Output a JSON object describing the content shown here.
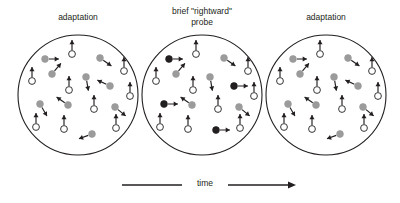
{
  "figure": {
    "type": "motion-adaptation-diagram",
    "width": 400,
    "height": 203,
    "background": "#ffffff",
    "stroke_color": "#231f20",
    "colors": {
      "outline": "#231f20",
      "adapting_dot_fill": "#9b9b9b",
      "probe_dot_fill": "#231f20",
      "open_dot_fill": "#ffffff",
      "text": "#231f20"
    }
  },
  "panels": [
    {
      "id": "panel-left",
      "label": "adaptation",
      "label_lines": [
        "adaptation"
      ],
      "cx": 78,
      "cy": 95,
      "r": 60,
      "label_x": 78,
      "label_y": 12,
      "dots": [
        {
          "x": -33,
          "y": -36,
          "kind": "adapting",
          "angle": 0
        },
        {
          "x": -6,
          "y": -41,
          "kind": "open",
          "angle": -90
        },
        {
          "x": 22,
          "y": -37,
          "kind": "adapting",
          "angle": 35
        },
        {
          "x": -26,
          "y": -21,
          "kind": "adapting",
          "angle": -50
        },
        {
          "x": 46,
          "y": -24,
          "kind": "open",
          "angle": -90
        },
        {
          "x": -46,
          "y": -14,
          "kind": "open",
          "angle": -90
        },
        {
          "x": 8,
          "y": -18,
          "kind": "adapting",
          "angle": 80
        },
        {
          "x": -9,
          "y": -5,
          "kind": "open",
          "angle": -90
        },
        {
          "x": 32,
          "y": -9,
          "kind": "adapting",
          "angle": -155
        },
        {
          "x": 52,
          "y": 1,
          "kind": "open",
          "angle": -90
        },
        {
          "x": -38,
          "y": 9,
          "kind": "adapting",
          "angle": 60
        },
        {
          "x": -10,
          "y": 10,
          "kind": "adapting",
          "angle": -145
        },
        {
          "x": 16,
          "y": 14,
          "kind": "open",
          "angle": -90
        },
        {
          "x": 37,
          "y": 12,
          "kind": "adapting",
          "angle": 40
        },
        {
          "x": -42,
          "y": 32,
          "kind": "open",
          "angle": -90
        },
        {
          "x": -14,
          "y": 34,
          "kind": "open",
          "angle": -90
        },
        {
          "x": 14,
          "y": 39,
          "kind": "adapting",
          "angle": 160
        },
        {
          "x": 38,
          "y": 33,
          "kind": "open",
          "angle": -90
        }
      ]
    },
    {
      "id": "panel-middle",
      "label": "brief \"rightward\" probe",
      "label_lines": [
        "brief \"rightward\"",
        "probe"
      ],
      "cx": 202,
      "cy": 95,
      "r": 60,
      "label_x": 202,
      "label_y": 6,
      "dots": [
        {
          "x": -33,
          "y": -36,
          "kind": "probe",
          "angle": 0
        },
        {
          "x": -6,
          "y": -41,
          "kind": "open",
          "angle": -90
        },
        {
          "x": 22,
          "y": -37,
          "kind": "adapting",
          "angle": 35
        },
        {
          "x": -26,
          "y": -21,
          "kind": "adapting",
          "angle": -50
        },
        {
          "x": 46,
          "y": -24,
          "kind": "open",
          "angle": -90
        },
        {
          "x": -46,
          "y": -14,
          "kind": "open",
          "angle": -90
        },
        {
          "x": 8,
          "y": -18,
          "kind": "adapting",
          "angle": 80
        },
        {
          "x": -9,
          "y": -5,
          "kind": "open",
          "angle": -90
        },
        {
          "x": 32,
          "y": -9,
          "kind": "probe",
          "angle": 0
        },
        {
          "x": 52,
          "y": 1,
          "kind": "open",
          "angle": -90
        },
        {
          "x": -38,
          "y": 9,
          "kind": "probe",
          "angle": 0
        },
        {
          "x": -10,
          "y": 10,
          "kind": "adapting",
          "angle": -145
        },
        {
          "x": 16,
          "y": 14,
          "kind": "open",
          "angle": -90
        },
        {
          "x": 37,
          "y": 12,
          "kind": "adapting",
          "angle": 40
        },
        {
          "x": -42,
          "y": 32,
          "kind": "open",
          "angle": -90
        },
        {
          "x": -14,
          "y": 34,
          "kind": "open",
          "angle": -90
        },
        {
          "x": 14,
          "y": 35,
          "kind": "probe",
          "angle": 0
        },
        {
          "x": 38,
          "y": 33,
          "kind": "open",
          "angle": -90
        }
      ]
    },
    {
      "id": "panel-right",
      "label": "adaptation",
      "label_lines": [
        "adaptation"
      ],
      "cx": 326,
      "cy": 95,
      "r": 60,
      "label_x": 326,
      "label_y": 12,
      "dots": [
        {
          "x": -33,
          "y": -36,
          "kind": "adapting",
          "angle": 0
        },
        {
          "x": -6,
          "y": -41,
          "kind": "open",
          "angle": -90
        },
        {
          "x": 22,
          "y": -37,
          "kind": "adapting",
          "angle": 35
        },
        {
          "x": -26,
          "y": -21,
          "kind": "adapting",
          "angle": -50
        },
        {
          "x": 46,
          "y": -24,
          "kind": "open",
          "angle": -90
        },
        {
          "x": -46,
          "y": -14,
          "kind": "open",
          "angle": -90
        },
        {
          "x": 8,
          "y": -18,
          "kind": "adapting",
          "angle": 80
        },
        {
          "x": -9,
          "y": -5,
          "kind": "open",
          "angle": -90
        },
        {
          "x": 32,
          "y": -9,
          "kind": "adapting",
          "angle": -155
        },
        {
          "x": 52,
          "y": 1,
          "kind": "open",
          "angle": -90
        },
        {
          "x": -38,
          "y": 9,
          "kind": "adapting",
          "angle": 60
        },
        {
          "x": -10,
          "y": 10,
          "kind": "adapting",
          "angle": -145
        },
        {
          "x": 16,
          "y": 14,
          "kind": "open",
          "angle": -90
        },
        {
          "x": 37,
          "y": 12,
          "kind": "adapting",
          "angle": 40
        },
        {
          "x": -42,
          "y": 32,
          "kind": "open",
          "angle": -90
        },
        {
          "x": -14,
          "y": 34,
          "kind": "open",
          "angle": -90
        },
        {
          "x": 14,
          "y": 39,
          "kind": "adapting",
          "angle": 160
        },
        {
          "x": 38,
          "y": 33,
          "kind": "open",
          "angle": -90
        }
      ]
    }
  ],
  "time_axis": {
    "label": "time",
    "x1": 122,
    "x2": 296,
    "y": 185,
    "label_x": 202,
    "label_y": 185
  }
}
